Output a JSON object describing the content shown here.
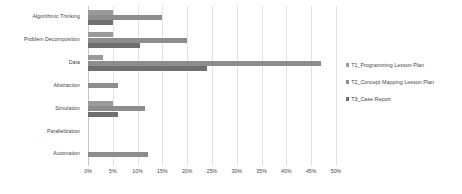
{
  "chart_data": {
    "type": "bar",
    "orientation": "horizontal",
    "title": "",
    "subtitle": "",
    "xlabel": "",
    "ylabel": "",
    "xlim": [
      0,
      50
    ],
    "xtick_labels": [
      "0%",
      "5%",
      "10%",
      "15%",
      "20%",
      "25%",
      "30%",
      "35%",
      "40%",
      "45%",
      "50%"
    ],
    "xtick_values": [
      0,
      5,
      10,
      15,
      20,
      25,
      30,
      35,
      40,
      45,
      50
    ],
    "grid": "vertical",
    "legend_position": "right",
    "categories": [
      "Algorithmic Thinking",
      "Problem Decomposition",
      "Data",
      "Abstraction",
      "Simulation",
      "Parallelization",
      "Automation"
    ],
    "series": [
      {
        "name": "T1_Programming Lesson Plan",
        "color": "#9a9a9a",
        "values": [
          5,
          5,
          3,
          0,
          5,
          0,
          0
        ]
      },
      {
        "name": "T2_Concept Mapping Lesson Plan",
        "color": "#8d8d8d",
        "values": [
          15,
          20,
          47,
          6,
          11.5,
          0,
          12
        ]
      },
      {
        "name": "T3_Case Report",
        "color": "#6f6f6f",
        "values": [
          5,
          10.5,
          24,
          0,
          6,
          0,
          0
        ]
      }
    ]
  },
  "legend": {
    "items": [
      {
        "label": "T1_Programming Lesson Plan",
        "color": "#9a9a9a"
      },
      {
        "label": "T2_Concept Mapping Lesson Plan",
        "color": "#8d8d8d"
      },
      {
        "label": "T3_Case Report",
        "color": "#6f6f6f"
      }
    ]
  },
  "colors": {
    "series_1": "#9a9a9a",
    "series_2": "#8d8d8d",
    "series_3": "#6f6f6f",
    "gridline": "#e3e3e3",
    "axis": "#c9c9c9",
    "text": "#3f3f3f",
    "background": "#ffffff"
  }
}
